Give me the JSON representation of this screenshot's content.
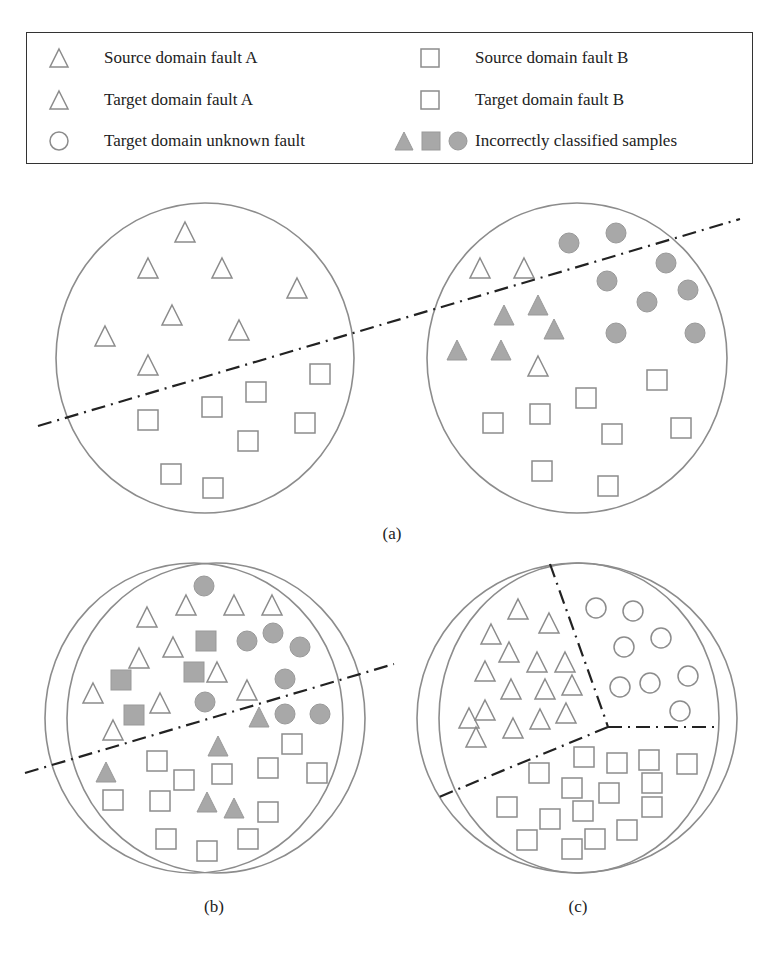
{
  "colors": {
    "outline": "#8c8c8c",
    "fill_incorrect": "#a8a8a8",
    "boundary_line": "#222222",
    "legend_border": "#333333",
    "text": "#222222"
  },
  "legend": {
    "items": [
      {
        "icon": "triangle-open-icon",
        "label": "Source domain fault A"
      },
      {
        "icon": "square-open-icon",
        "label": "Source domain fault B"
      },
      {
        "icon": "triangle-open-icon",
        "label": "Target domain fault A"
      },
      {
        "icon": "square-open-icon",
        "label": "Target domain fault B"
      },
      {
        "icon": "circle-open-icon",
        "label": "Target domain unknown fault"
      },
      {
        "icon": "filled-triangle-square-circle-icon",
        "label": "Incorrectly classified samples"
      }
    ]
  },
  "panels": {
    "a": {
      "label": "(a)",
      "left_domain": {
        "circles": [
          {
            "cx": 205,
            "cy": 358,
            "rx": 149,
            "ry": 155
          }
        ],
        "open_triangles": [
          [
            185,
            232
          ],
          [
            148,
            268
          ],
          [
            222,
            268
          ],
          [
            297,
            288
          ],
          [
            172,
            315
          ],
          [
            239,
            330
          ],
          [
            105,
            336
          ],
          [
            148,
            365
          ]
        ],
        "open_squares": [
          [
            148,
            420
          ],
          [
            212,
            407
          ],
          [
            256,
            392
          ],
          [
            320,
            374
          ],
          [
            305,
            423
          ],
          [
            248,
            441
          ],
          [
            171,
            474
          ],
          [
            213,
            488
          ]
        ]
      },
      "right_domain": {
        "circles": [
          {
            "cx": 577,
            "cy": 358,
            "rx": 150,
            "ry": 155
          }
        ],
        "open_triangles": [
          [
            480,
            268
          ],
          [
            524,
            268
          ],
          [
            538,
            366
          ]
        ],
        "filled_triangles": [
          [
            538,
            305
          ],
          [
            504,
            315
          ],
          [
            554,
            329
          ],
          [
            457,
            350
          ],
          [
            501,
            350
          ]
        ],
        "filled_circles": [
          [
            569,
            243
          ],
          [
            616,
            233
          ],
          [
            666,
            263
          ],
          [
            607,
            281
          ],
          [
            647,
            302
          ],
          [
            688,
            290
          ],
          [
            616,
            333
          ],
          [
            695,
            333
          ]
        ],
        "open_squares": [
          [
            657,
            380
          ],
          [
            586,
            398
          ],
          [
            540,
            414
          ],
          [
            493,
            423
          ],
          [
            612,
            434
          ],
          [
            681,
            428
          ],
          [
            542,
            471
          ],
          [
            608,
            486
          ]
        ]
      },
      "boundary": {
        "points": [
          [
            38,
            426
          ],
          [
            740,
            219
          ]
        ]
      }
    },
    "b": {
      "label": "(b)",
      "circles": [
        {
          "cx": 194,
          "cy": 718,
          "rx": 149,
          "ry": 155
        },
        {
          "cx": 216,
          "cy": 718,
          "rx": 149,
          "ry": 155
        }
      ],
      "open_triangles": [
        [
          147,
          617
        ],
        [
          186,
          605
        ],
        [
          234,
          605
        ],
        [
          272,
          605
        ],
        [
          173,
          647
        ],
        [
          139,
          658
        ],
        [
          217,
          672
        ],
        [
          247,
          690
        ],
        [
          93,
          693
        ],
        [
          160,
          703
        ],
        [
          113,
          730
        ]
      ],
      "filled_squares": [
        [
          206,
          641
        ],
        [
          194,
          672
        ],
        [
          121,
          680
        ],
        [
          134,
          715
        ]
      ],
      "filled_circles": [
        [
          204,
          586
        ],
        [
          247,
          641
        ],
        [
          273,
          633
        ],
        [
          300,
          647
        ],
        [
          285,
          679
        ],
        [
          205,
          702
        ],
        [
          285,
          714
        ],
        [
          320,
          714
        ]
      ],
      "filled_triangles": [
        [
          259,
          717
        ],
        [
          218,
          746
        ],
        [
          106,
          772
        ],
        [
          207,
          802
        ],
        [
          234,
          808
        ]
      ],
      "open_squares": [
        [
          292,
          744
        ],
        [
          157,
          761
        ],
        [
          184,
          780
        ],
        [
          222,
          774
        ],
        [
          268,
          768
        ],
        [
          317,
          773
        ],
        [
          113,
          800
        ],
        [
          160,
          801
        ],
        [
          268,
          812
        ],
        [
          166,
          839
        ],
        [
          207,
          851
        ],
        [
          248,
          839
        ]
      ],
      "boundary": {
        "points": [
          [
            25,
            773
          ],
          [
            394,
            664
          ]
        ]
      }
    },
    "c": {
      "label": "(c)",
      "circles": [
        {
          "cx": 577,
          "cy": 718,
          "rx": 160,
          "ry": 155
        },
        {
          "cx": 579,
          "cy": 718,
          "rx": 140,
          "ry": 155
        }
      ],
      "open_triangles": [
        [
          518,
          609
        ],
        [
          549,
          623
        ],
        [
          491,
          634
        ],
        [
          509,
          652
        ],
        [
          537,
          662
        ],
        [
          565,
          662
        ],
        [
          485,
          671
        ],
        [
          511,
          689
        ],
        [
          545,
          689
        ],
        [
          572,
          685
        ],
        [
          485,
          710
        ],
        [
          469,
          718
        ],
        [
          513,
          728
        ],
        [
          540,
          719
        ],
        [
          566,
          713
        ],
        [
          476,
          737
        ]
      ],
      "open_circles": [
        [
          596,
          608
        ],
        [
          633,
          611
        ],
        [
          624,
          647
        ],
        [
          661,
          638
        ],
        [
          620,
          687
        ],
        [
          650,
          683
        ],
        [
          688,
          676
        ],
        [
          680,
          711
        ]
      ],
      "open_squares": [
        [
          584,
          757
        ],
        [
          617,
          763
        ],
        [
          649,
          760
        ],
        [
          687,
          764
        ],
        [
          539,
          773
        ],
        [
          572,
          788
        ],
        [
          609,
          793
        ],
        [
          652,
          783
        ],
        [
          507,
          807
        ],
        [
          652,
          807
        ],
        [
          583,
          811
        ],
        [
          550,
          819
        ],
        [
          627,
          830
        ],
        [
          595,
          839
        ],
        [
          527,
          840
        ],
        [
          572,
          849
        ]
      ],
      "boundaries": [
        {
          "points": [
            [
              550,
              564
            ],
            [
              605,
              718
            ],
            [
              608,
              727
            ]
          ]
        },
        {
          "points": [
            [
              608,
              727
            ],
            [
              716,
              727
            ]
          ]
        },
        {
          "points": [
            [
              608,
              727
            ],
            [
              439,
              797
            ]
          ]
        }
      ]
    }
  }
}
